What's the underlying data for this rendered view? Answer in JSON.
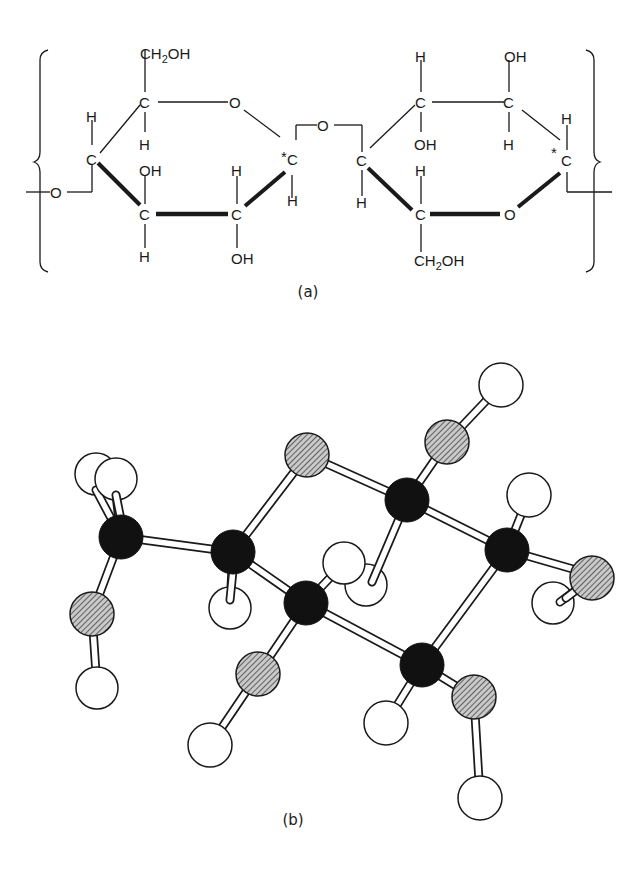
{
  "figure": {
    "panel_a": {
      "caption": "(a)",
      "description": "Cellobiose repeat unit of cellulose (Haworth projection), bracketed repeating unit",
      "atom_labels": {
        "ch2oh": "CH₂OH",
        "oh": "OH",
        "h": "H",
        "c": "C",
        "o": "O",
        "star": "*"
      }
    },
    "panel_b": {
      "caption": "(b)",
      "description": "Ball-and-stick model of glucose residue (chair conformation)",
      "legend": {
        "carbon": "black filled sphere",
        "oxygen": "hatched grey sphere",
        "hydrogen": "open white sphere"
      },
      "colors": {
        "carbon": "#111111",
        "oxygen": "#8f8f8f",
        "hydrogen": "#ffffff",
        "bond": "#1a1a1a"
      }
    }
  }
}
